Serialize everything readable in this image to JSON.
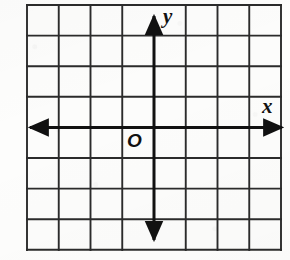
{
  "figure": {
    "name": "coordinate-plane",
    "background_color": "#fdfdfc",
    "ink_color": "#1a1a1a"
  },
  "grid": {
    "columns": 8,
    "rows": 8,
    "left": 27,
    "top": 5,
    "right": 281,
    "bottom": 250,
    "cell_width": 31.75,
    "cell_height": 30.6,
    "line_color": "#2b2b2b",
    "line_width": 1.9,
    "x_lines": [
      27,
      58.75,
      90.5,
      122.25,
      154,
      185.75,
      217.5,
      249.25,
      281
    ],
    "y_lines": [
      5,
      35.6,
      66.2,
      96.8,
      127.4,
      158,
      188.6,
      219.2,
      249.8
    ]
  },
  "axes": {
    "origin_x": 154,
    "origin_y": 127.4,
    "line_color": "#111111",
    "line_width": 3.0,
    "x_axis": {
      "label": "x",
      "label_left": 262,
      "label_top": 96,
      "start_x": 25,
      "end_x": 286,
      "y": 127.4,
      "arrow_left": true,
      "arrow_right": true
    },
    "y_axis": {
      "label": "y",
      "label_left": 163,
      "label_top": 6,
      "x": 154,
      "start_y": 11,
      "end_y": 244,
      "arrow_up": true,
      "arrow_down": true
    }
  },
  "origin_marker": {
    "label": "O",
    "left": 127,
    "top": 131
  }
}
